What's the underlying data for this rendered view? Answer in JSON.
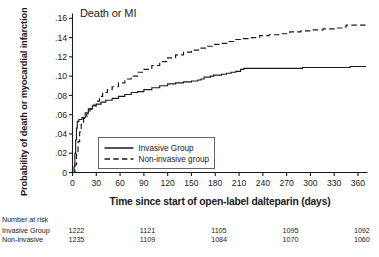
{
  "figure": {
    "title": "Death or MI",
    "xlabel": "Time since start of open-label dalteparin (days)",
    "ylabel": "Probability of death or myocardial infarction"
  },
  "legend": {
    "position": "inside-lower-left",
    "entries": [
      {
        "label": "Invasive Group",
        "style": "solid",
        "color": "#1a1a1a"
      },
      {
        "label": "Non-invasive group",
        "style": "dashed",
        "color": "#1a1a1a"
      }
    ]
  },
  "risk_table": {
    "caption": "Number at risk",
    "row_labels": [
      "Invasive Group",
      "Non-invasive"
    ],
    "columns": [
      "0",
      "90",
      "180",
      "270",
      "360"
    ],
    "rows": [
      {
        "label": "Invasive Group",
        "values": [
          "1222",
          "1121",
          "1105",
          "1095",
          "1092"
        ]
      },
      {
        "label": "Non-invasive",
        "values": [
          "1235",
          "1109",
          "1084",
          "1070",
          "1060"
        ]
      }
    ]
  },
  "chart_data": {
    "type": "line",
    "title": "Death or MI",
    "subtitle": "",
    "xlabel": "Time since start of open-label dalteparin (days)",
    "ylabel": "Probability of death or myocardial infarction",
    "xlim": [
      0,
      372
    ],
    "ylim": [
      0,
      0.165
    ],
    "xticks": [
      0,
      30,
      60,
      90,
      120,
      150,
      180,
      210,
      240,
      270,
      300,
      330,
      360
    ],
    "xtick_labels": [
      "0",
      "30",
      "60",
      "90",
      "120",
      "150",
      "180",
      "210",
      "240",
      "270",
      "300",
      "330",
      "360"
    ],
    "yticks": [
      0,
      0.02,
      0.04,
      0.06,
      0.08,
      0.1,
      0.12,
      0.14,
      0.16
    ],
    "ytick_labels": [
      "0",
      ".02",
      ".04",
      ".06",
      ".08",
      ".10",
      ".12",
      ".14",
      ".16"
    ],
    "grid": false,
    "legend_position": "inside lower-left",
    "annotations": [
      "Death or MI"
    ],
    "series": [
      {
        "name": "Invasive Group",
        "style": "solid",
        "color": "#1a1a1a",
        "points": [
          [
            0,
            0.0
          ],
          [
            2,
            0.006
          ],
          [
            3,
            0.02
          ],
          [
            4,
            0.034
          ],
          [
            5,
            0.046
          ],
          [
            6,
            0.053
          ],
          [
            8,
            0.055
          ],
          [
            12,
            0.057
          ],
          [
            16,
            0.062
          ],
          [
            20,
            0.066
          ],
          [
            25,
            0.069
          ],
          [
            30,
            0.071
          ],
          [
            36,
            0.073
          ],
          [
            42,
            0.075
          ],
          [
            50,
            0.077
          ],
          [
            58,
            0.079
          ],
          [
            66,
            0.081
          ],
          [
            74,
            0.083
          ],
          [
            82,
            0.084
          ],
          [
            90,
            0.086
          ],
          [
            100,
            0.088
          ],
          [
            110,
            0.09
          ],
          [
            120,
            0.092
          ],
          [
            130,
            0.093
          ],
          [
            140,
            0.094
          ],
          [
            150,
            0.095
          ],
          [
            158,
            0.096
          ],
          [
            162,
            0.097
          ],
          [
            166,
            0.099
          ],
          [
            170,
            0.099
          ],
          [
            174,
            0.1
          ],
          [
            178,
            0.101
          ],
          [
            182,
            0.101
          ],
          [
            188,
            0.102
          ],
          [
            194,
            0.103
          ],
          [
            200,
            0.104
          ],
          [
            206,
            0.105
          ],
          [
            212,
            0.107
          ],
          [
            216,
            0.108
          ],
          [
            230,
            0.108
          ],
          [
            260,
            0.108
          ],
          [
            290,
            0.109
          ],
          [
            320,
            0.109
          ],
          [
            350,
            0.11
          ],
          [
            370,
            0.11
          ]
        ]
      },
      {
        "name": "Non-invasive group",
        "style": "dashed",
        "color": "#1a1a1a",
        "points": [
          [
            0,
            0.0
          ],
          [
            3,
            0.008
          ],
          [
            5,
            0.02
          ],
          [
            7,
            0.032
          ],
          [
            9,
            0.042
          ],
          [
            11,
            0.05
          ],
          [
            14,
            0.056
          ],
          [
            18,
            0.061
          ],
          [
            22,
            0.066
          ],
          [
            26,
            0.07
          ],
          [
            30,
            0.074
          ],
          [
            34,
            0.079
          ],
          [
            38,
            0.083
          ],
          [
            44,
            0.086
          ],
          [
            50,
            0.089
          ],
          [
            58,
            0.093
          ],
          [
            66,
            0.097
          ],
          [
            74,
            0.1
          ],
          [
            82,
            0.104
          ],
          [
            90,
            0.107
          ],
          [
            100,
            0.111
          ],
          [
            110,
            0.115
          ],
          [
            120,
            0.119
          ],
          [
            130,
            0.122
          ],
          [
            140,
            0.125
          ],
          [
            150,
            0.127
          ],
          [
            160,
            0.129
          ],
          [
            170,
            0.131
          ],
          [
            178,
            0.133
          ],
          [
            186,
            0.134
          ],
          [
            196,
            0.136
          ],
          [
            206,
            0.138
          ],
          [
            214,
            0.139
          ],
          [
            224,
            0.14
          ],
          [
            236,
            0.142
          ],
          [
            248,
            0.143
          ],
          [
            260,
            0.144
          ],
          [
            274,
            0.146
          ],
          [
            288,
            0.147
          ],
          [
            302,
            0.148
          ],
          [
            316,
            0.149
          ],
          [
            330,
            0.15
          ],
          [
            342,
            0.151
          ],
          [
            345,
            0.153
          ],
          [
            358,
            0.153
          ],
          [
            370,
            0.154
          ]
        ]
      }
    ]
  }
}
